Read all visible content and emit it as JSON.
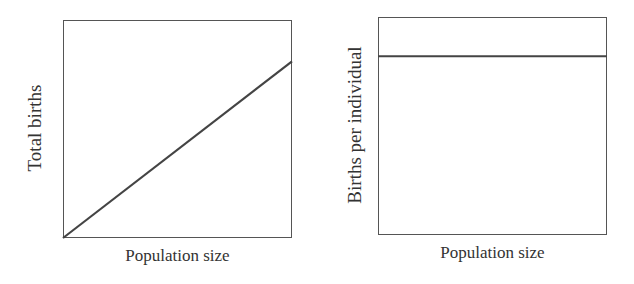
{
  "chart_data": [
    {
      "type": "line",
      "title": "",
      "xlabel": "Population size",
      "ylabel": "Total births",
      "grid": false,
      "ticks": false,
      "series": [
        {
          "name": "Total births",
          "x": [
            0,
            1
          ],
          "values": [
            0,
            0.81
          ]
        }
      ],
      "xlim": [
        0,
        1
      ],
      "ylim": [
        0,
        1
      ],
      "description": "Linear increase of total births with population size"
    },
    {
      "type": "line",
      "title": "",
      "xlabel": "Population size",
      "ylabel": "Births per individual",
      "grid": false,
      "ticks": false,
      "series": [
        {
          "name": "Births per individual",
          "x": [
            0,
            1
          ],
          "values": [
            0.82,
            0.82
          ]
        }
      ],
      "xlim": [
        0,
        1
      ],
      "ylim": [
        0,
        1
      ],
      "description": "Constant births per individual regardless of population size"
    }
  ],
  "colors": {
    "line": "#444444",
    "frame": "#555555",
    "text": "#333333"
  }
}
